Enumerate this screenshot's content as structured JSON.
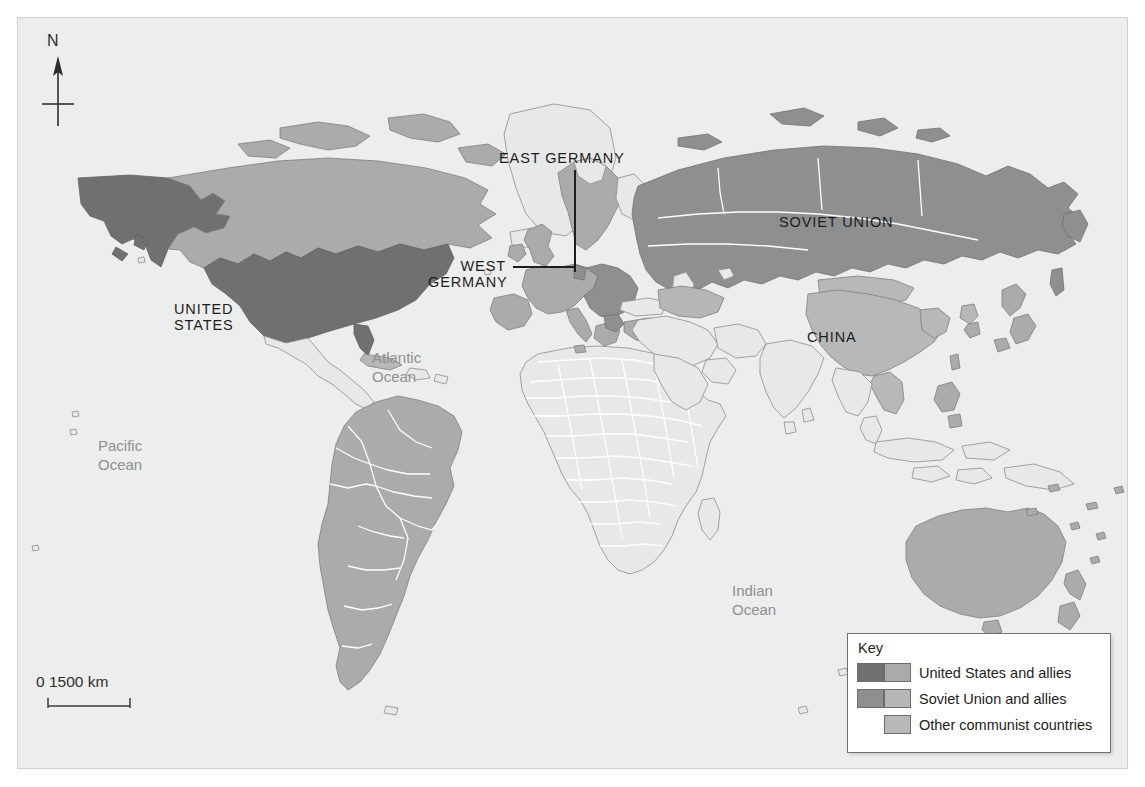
{
  "map": {
    "title": "Cold War alliances world map",
    "background_color": "#eceded",
    "border_color": "#cfd0d0",
    "colors": {
      "us_and_allies_dark": "#6f7072",
      "us_and_allies_light": "#a9abac",
      "soviet_and_allies_dark": "#8d8f90",
      "soviet_and_allies_light": "#b4b6b7",
      "other_communist": "#b6b8b9",
      "neutral_land": "#e7e8e8",
      "coastline": "#6f7173",
      "internal_border": "#ffffff"
    },
    "north_arrow": {
      "label": "N"
    },
    "scale": {
      "start_value": "0",
      "end_value": "1500 km",
      "text": "0   1500 km"
    },
    "country_labels": [
      {
        "name": "united-states",
        "text_lines": [
          "UNITED",
          "STATES"
        ],
        "x": 173,
        "y": 283,
        "style": "caps"
      },
      {
        "name": "soviet-union",
        "text_lines": [
          "SOVIET UNION"
        ],
        "x": 778,
        "y": 196,
        "style": "caps"
      },
      {
        "name": "china",
        "text_lines": [
          "CHINA"
        ],
        "x": 806,
        "y": 311,
        "style": "caps"
      },
      {
        "name": "east-germany",
        "text_lines": [
          "EAST GERMANY"
        ],
        "x": 498,
        "y": 132,
        "style": "caps"
      },
      {
        "name": "west-germany",
        "text_lines": [
          "WEST",
          "GERMANY"
        ],
        "x": 427,
        "y": 240,
        "style": "caps"
      }
    ],
    "ocean_labels": [
      {
        "name": "pacific-ocean",
        "text_lines": [
          "Pacific",
          "Ocean"
        ],
        "x": 97,
        "y": 418
      },
      {
        "name": "atlantic-ocean",
        "text_lines": [
          "Atlantic",
          "Ocean"
        ],
        "x": 371,
        "y": 330
      },
      {
        "name": "indian-ocean",
        "text_lines": [
          "Indian",
          "Ocean"
        ],
        "x": 731,
        "y": 563
      }
    ]
  },
  "key": {
    "title": "Key",
    "entries": [
      {
        "name": "us-and-allies",
        "label": "United States and allies",
        "swatch_left": "#6f7072",
        "swatch_right": "#a9abac",
        "swatch_left_visible": true
      },
      {
        "name": "soviet-union-and-allies",
        "label": "Soviet Union and allies",
        "swatch_left": "#8d8f90",
        "swatch_right": "#b4b6b7",
        "swatch_left_visible": true
      },
      {
        "name": "other-communist-countries",
        "label": "Other communist countries",
        "swatch_left": "",
        "swatch_right": "#b6b8b9",
        "swatch_left_visible": false
      }
    ]
  }
}
